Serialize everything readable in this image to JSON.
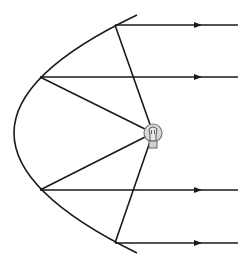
{
  "diagram": {
    "title": "Parabolic reflector with light source at focus",
    "type": "ray-optics",
    "colors": {
      "line": "#1a1a1a",
      "bulb_fill": "#d9d9d9",
      "bulb_stroke": "#777777",
      "background": "#ffffff"
    },
    "mirror": {
      "shape": "parabola",
      "top": [
        137,
        15
      ],
      "vertex": [
        14,
        133
      ],
      "bottom": [
        137,
        253
      ]
    },
    "source": {
      "icon": "light-bulb-icon",
      "position": [
        153,
        133
      ]
    },
    "rays": [
      {
        "hit": [
          115,
          25
        ],
        "end": [
          238,
          25
        ],
        "arrow_x": 198
      },
      {
        "hit": [
          40,
          77
        ],
        "end": [
          238,
          77
        ],
        "arrow_x": 198
      },
      {
        "hit": [
          40,
          190
        ],
        "end": [
          238,
          190
        ],
        "arrow_x": 198
      },
      {
        "hit": [
          115,
          243
        ],
        "end": [
          238,
          243
        ],
        "arrow_x": 198
      }
    ]
  }
}
